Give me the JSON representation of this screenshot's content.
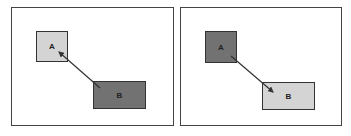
{
  "colors": {
    "light_box": "#d4d4d4",
    "dark_box": "#727272",
    "arrow": "#333333",
    "frame": "#444444"
  },
  "panels": [
    {
      "id": "left",
      "boxes": [
        {
          "label": "A",
          "shade": "light"
        },
        {
          "label": "B",
          "shade": "dark"
        }
      ],
      "arrow": {
        "from": "B",
        "to": "A"
      }
    },
    {
      "id": "right",
      "boxes": [
        {
          "label": "A",
          "shade": "dark"
        },
        {
          "label": "B",
          "shade": "light"
        }
      ],
      "arrow": {
        "from": "A",
        "to": "B"
      }
    }
  ]
}
